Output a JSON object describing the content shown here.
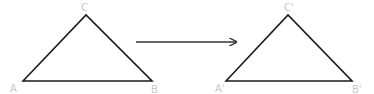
{
  "diagram": {
    "type": "geometric-transformation",
    "colors": {
      "stroke": "#1a1a1a",
      "label": "#c8c8c8",
      "background": "#ffffff"
    },
    "original": {
      "labels": {
        "a": "A",
        "b": "B",
        "c": "C"
      }
    },
    "image": {
      "labels": {
        "a": "A'",
        "b": "B'",
        "c": "C'"
      }
    },
    "arrow": {
      "direction": "right"
    }
  }
}
